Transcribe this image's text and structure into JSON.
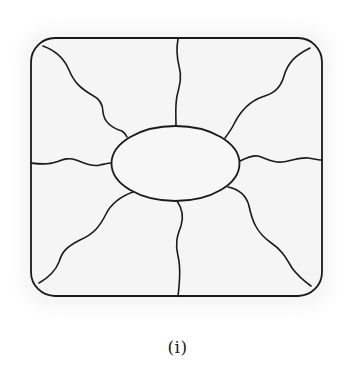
{
  "figure": {
    "caption": "(i)",
    "colors": {
      "stroke": "#1a1a1a",
      "fill": "#f4f4f4",
      "background": "#ffffff"
    },
    "outer_shape": {
      "type": "rounded-rectangle",
      "x": 31,
      "y": 38,
      "width": 291,
      "height": 258,
      "corner_radius": 24
    },
    "center_shape": {
      "type": "ellipse",
      "cx": 175.5,
      "cy": 163.5,
      "rx": 64,
      "ry": 37.5
    },
    "radial_lines": [
      {
        "name": "top",
        "from": "outer-top-edge",
        "to": "ellipse"
      },
      {
        "name": "top-right",
        "from": "outer-top-right-corner",
        "to": "ellipse"
      },
      {
        "name": "right",
        "from": "ellipse",
        "to": "outer-right-edge"
      },
      {
        "name": "bottom-right",
        "from": "ellipse",
        "to": "outer-bottom-right-corner"
      },
      {
        "name": "bottom",
        "from": "ellipse",
        "to": "outer-bottom-edge"
      },
      {
        "name": "bottom-left",
        "from": "outer-bottom-left-corner",
        "to": "ellipse"
      },
      {
        "name": "left",
        "from": "outer-left-edge",
        "to": "ellipse"
      },
      {
        "name": "top-left",
        "from": "outer-top-left-corner",
        "to": "ellipse"
      }
    ],
    "region_count": 8
  }
}
